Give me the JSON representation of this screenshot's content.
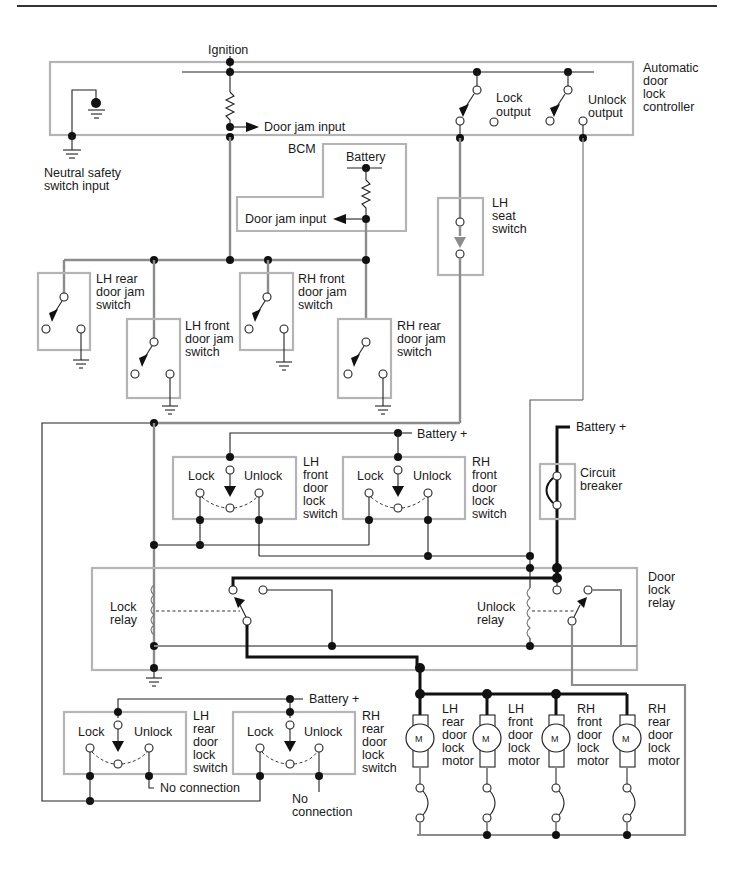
{
  "diagram": {
    "colors": {
      "box": "#b4b4b4",
      "wire": "#222222",
      "gray_wire": "#8c8c8c",
      "heavy_wire": "#111111"
    },
    "top_labels": {
      "ignition": "Ignition",
      "controller": [
        "Automatic",
        "door",
        "lock",
        "controller"
      ],
      "door_jam_input_1": "Door jam input",
      "lock_output": [
        "Lock",
        "output"
      ],
      "unlock_output": [
        "Unlock",
        "output"
      ],
      "neutral_safety": [
        "Neutral safety",
        "switch input"
      ]
    },
    "bcm": {
      "title": "BCM",
      "battery": "Battery",
      "door_jam_input": "Door jam input"
    },
    "seat_switch": [
      "LH",
      "seat",
      "switch"
    ],
    "jam_switches": [
      {
        "label": [
          "LH rear",
          "door jam",
          "switch"
        ]
      },
      {
        "label": [
          "LH front",
          "door jam",
          "switch"
        ]
      },
      {
        "label": [
          "RH front",
          "door jam",
          "switch"
        ]
      },
      {
        "label": [
          "RH rear",
          "door jam",
          "switch"
        ]
      }
    ],
    "front_lock_switches": {
      "battery": "Battery  +",
      "lock": "Lock",
      "unlock": "Unlock",
      "lh": [
        "LH",
        "front",
        "door",
        "lock",
        "switch"
      ],
      "rh": [
        "RH",
        "front",
        "door",
        "lock",
        "switch"
      ]
    },
    "circuit_breaker": {
      "battery": "Battery  +",
      "label": [
        "Circuit",
        "breaker"
      ]
    },
    "relay": {
      "lock_relay": [
        "Lock",
        "relay"
      ],
      "unlock_relay": [
        "Unlock",
        "relay"
      ],
      "door_lock_relay": [
        "Door",
        "lock",
        "relay"
      ]
    },
    "rear_lock_switches": {
      "battery": "Battery  +",
      "lock": "Lock",
      "unlock": "Unlock",
      "lh": [
        "LH",
        "rear",
        "door",
        "lock",
        "switch"
      ],
      "rh": [
        "RH",
        "rear",
        "door",
        "lock",
        "switch"
      ],
      "no_connection_1": "No connection",
      "no_connection_2": [
        "No",
        "connection"
      ]
    },
    "motors": [
      {
        "symbol": "M",
        "label": [
          "LH",
          "rear",
          "door",
          "lock",
          "motor"
        ]
      },
      {
        "symbol": "M",
        "label": [
          "LH",
          "front",
          "door",
          "lock",
          "motor"
        ]
      },
      {
        "symbol": "M",
        "label": [
          "RH",
          "front",
          "door",
          "lock",
          "motor"
        ]
      },
      {
        "symbol": "M",
        "label": [
          "RH",
          "rear",
          "door",
          "lock",
          "motor"
        ]
      }
    ]
  }
}
